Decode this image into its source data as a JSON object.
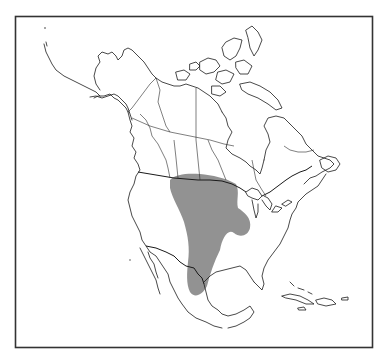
{
  "map": {
    "type": "species-range-map",
    "region": "North America",
    "frame": {
      "x": 15,
      "y": 16,
      "width": 358,
      "height": 332,
      "stroke": "#333333"
    },
    "colors": {
      "background": "#ffffff",
      "outline": "#1a1a1a",
      "range_fill": "#8c8c8c"
    },
    "range": {
      "label": "",
      "description": "Shaded distribution from southern Canadian prairies south through the Great Plains into northeastern Mexico, with an eastward lobe toward the Great Lakes region"
    },
    "countries_shown": [
      "Canada",
      "United States",
      "Mexico",
      "Greenland (partial)",
      "Caribbean islands"
    ]
  }
}
